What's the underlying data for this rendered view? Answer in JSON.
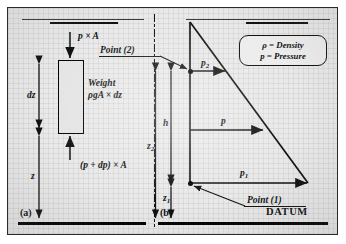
{
  "figure": {
    "title_visible": false,
    "panels": [
      {
        "id": "a",
        "label": "(a)"
      },
      {
        "id": "b",
        "label": "(b)"
      }
    ],
    "datum_label": "DATUM"
  },
  "legend": {
    "line1": "ρ = Density",
    "line2": "p = Pressure",
    "symbols": [
      {
        "symbol": "ρ",
        "meaning": "Density"
      },
      {
        "symbol": "p",
        "meaning": "Pressure"
      }
    ]
  },
  "panel_a": {
    "label": "(a)",
    "top_force": "p × A",
    "weight_line1": "Weight",
    "weight_line2": "ρgA × dz",
    "bottom_force": "(p + dp) × A",
    "dim_dz": "dz",
    "dim_z": "z",
    "free_surface": true,
    "element": {
      "shape": "rectangle",
      "outline_color": "#000000"
    }
  },
  "panel_b": {
    "label": "(b)",
    "point_2": "Point (2)",
    "point_1": "Point (1)",
    "pressure_top": "p",
    "pressure_top_sub": "2",
    "pressure_mid": "p",
    "pressure_bottom": "p",
    "pressure_bottom_sub": "1",
    "dim_h": "h",
    "dim_z2": "z",
    "dim_z2_sub": "2",
    "dim_z1": "z",
    "dim_z1_sub": "1",
    "datum": "DATUM",
    "free_surface": true,
    "distribution": {
      "type": "triangular",
      "apex": "free-surface",
      "base": "point-1"
    }
  },
  "colors": {
    "ink": "#111111",
    "paper": "#e9e9e9",
    "frame": "#2b2b2b",
    "element_fill": "#e4e4e4"
  }
}
